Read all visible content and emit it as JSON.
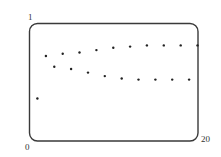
{
  "chart_data": {
    "type": "scatter",
    "title": "",
    "xlabel": "",
    "ylabel": "",
    "xlim": [
      0,
      20
    ],
    "ylim": [
      0,
      1
    ],
    "grid": false,
    "legend": null,
    "tick_labels": {
      "y_top": "1",
      "origin": "0",
      "x_right": "20"
    },
    "series": [
      {
        "name": "points",
        "x": [
          1,
          2,
          3,
          4,
          5,
          6,
          7,
          8,
          9,
          10,
          11,
          12,
          13,
          14,
          15,
          16,
          17,
          18,
          19,
          20
        ],
        "y": [
          0.36,
          0.72,
          0.63,
          0.74,
          0.61,
          0.75,
          0.58,
          0.77,
          0.55,
          0.79,
          0.53,
          0.8,
          0.52,
          0.81,
          0.52,
          0.81,
          0.52,
          0.81,
          0.52,
          0.81
        ]
      }
    ],
    "colors": {
      "frame": "#3a3a3a",
      "points": "#222222",
      "labels": "#333333"
    }
  }
}
